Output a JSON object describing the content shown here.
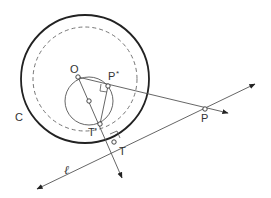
{
  "diagram": {
    "type": "geometry",
    "colors": {
      "stroke": "#333333",
      "thin": "#555555",
      "dashed": "#666666",
      "background": "#ffffff"
    },
    "labels": {
      "O": "O",
      "P_star": "P*",
      "P_star_sup": "*",
      "P_base": "P",
      "T_prime": "T'",
      "C": "C",
      "P": "P",
      "T": "T",
      "ell": "ℓ"
    },
    "shapes": {
      "circle_C": {
        "cx": 85,
        "cy": 79,
        "r": 64
      },
      "dashed_circle": {
        "cx": 85,
        "cy": 79,
        "r": 52
      },
      "small_circle": {
        "cx": 89,
        "cy": 101,
        "r": 24
      },
      "points": {
        "O": [
          78,
          77
        ],
        "P_star": [
          108,
          86
        ],
        "T_prime": [
          100,
          124
        ],
        "midpoint": [
          89,
          101
        ],
        "P": [
          205,
          109
        ],
        "T": [
          114,
          142
        ]
      },
      "line_ell": {
        "from": [
          37,
          189
        ],
        "to": [
          255,
          84
        ]
      },
      "ray_OP": {
        "from": [
          78,
          77
        ],
        "to": [
          228,
          113
        ]
      },
      "ray_OT": {
        "from": [
          78,
          77
        ],
        "to": [
          122,
          178
        ]
      }
    }
  }
}
